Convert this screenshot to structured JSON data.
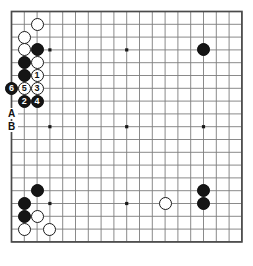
{
  "diagram": {
    "type": "go-board-diagram",
    "title": "",
    "board_size": 19,
    "geometry": {
      "origin_x": 11.5,
      "origin_y": 11.5,
      "spacing": 12.8,
      "stone_radius": 6.6,
      "line_color": "#7d7d7d",
      "border_color": "#4a4a4a",
      "background_color": "#ffffff"
    },
    "colors": {
      "black_stone": "#151515",
      "white_stone": "#ffffff",
      "stone_outline": "#1b1b1b",
      "black_number_text": "#ffffff",
      "white_number_text": "#111111",
      "label_text": "#101010"
    },
    "star_points": [
      {
        "col": 4,
        "row": 4
      },
      {
        "col": 10,
        "row": 4
      },
      {
        "col": 16,
        "row": 4
      },
      {
        "col": 4,
        "row": 10
      },
      {
        "col": 10,
        "row": 10
      },
      {
        "col": 16,
        "row": 10
      },
      {
        "col": 4,
        "row": 16
      },
      {
        "col": 10,
        "row": 16
      },
      {
        "col": 16,
        "row": 16
      }
    ],
    "stones": [
      {
        "col": 3,
        "row": 2,
        "color": "white",
        "label": ""
      },
      {
        "col": 2,
        "row": 3,
        "color": "white",
        "label": ""
      },
      {
        "col": 2,
        "row": 4,
        "color": "white",
        "label": ""
      },
      {
        "col": 3,
        "row": 4,
        "color": "black",
        "label": ""
      },
      {
        "col": 2,
        "row": 5,
        "color": "black",
        "label": ""
      },
      {
        "col": 3,
        "row": 5,
        "color": "white",
        "label": ""
      },
      {
        "col": 2,
        "row": 6,
        "color": "black",
        "label": ""
      },
      {
        "col": 3,
        "row": 6,
        "color": "white",
        "label": "1"
      },
      {
        "col": 1,
        "row": 7,
        "color": "black",
        "label": "6"
      },
      {
        "col": 2,
        "row": 7,
        "color": "white",
        "label": "5"
      },
      {
        "col": 3,
        "row": 7,
        "color": "white",
        "label": "3"
      },
      {
        "col": 2,
        "row": 8,
        "color": "black",
        "label": "2"
      },
      {
        "col": 3,
        "row": 8,
        "color": "black",
        "label": "4"
      },
      {
        "col": 16,
        "row": 4,
        "color": "black",
        "label": ""
      },
      {
        "col": 3,
        "row": 15,
        "color": "black",
        "label": ""
      },
      {
        "col": 2,
        "row": 16,
        "color": "black",
        "label": ""
      },
      {
        "col": 2,
        "row": 17,
        "color": "black",
        "label": ""
      },
      {
        "col": 3,
        "row": 17,
        "color": "white",
        "label": ""
      },
      {
        "col": 2,
        "row": 18,
        "color": "white",
        "label": ""
      },
      {
        "col": 4,
        "row": 18,
        "color": "white",
        "label": ""
      },
      {
        "col": 13,
        "row": 16,
        "color": "white",
        "label": ""
      },
      {
        "col": 16,
        "row": 15,
        "color": "black",
        "label": ""
      },
      {
        "col": 16,
        "row": 16,
        "color": "black",
        "label": ""
      }
    ],
    "point_labels": [
      {
        "col": 1,
        "row": 9,
        "text": "A"
      },
      {
        "col": 1,
        "row": 10,
        "text": "B"
      }
    ],
    "move_sequence": [
      {
        "number": "1",
        "color": "white",
        "col": 3,
        "row": 6
      },
      {
        "number": "2",
        "color": "black",
        "col": 2,
        "row": 8
      },
      {
        "number": "3",
        "color": "white",
        "col": 3,
        "row": 7
      },
      {
        "number": "4",
        "color": "black",
        "col": 3,
        "row": 8
      },
      {
        "number": "5",
        "color": "white",
        "col": 2,
        "row": 7
      },
      {
        "number": "6",
        "color": "black",
        "col": 1,
        "row": 7
      }
    ]
  }
}
